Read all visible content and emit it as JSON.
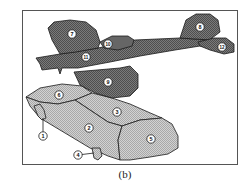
{
  "figure": {
    "caption": "(b)",
    "frame": {
      "x": 22,
      "y": 10,
      "width": 215,
      "height": 155,
      "stroke": "#555555"
    },
    "colors": {
      "airplane_fill": "#6e6e6e",
      "airplane_light_fill": "#8a8a8a",
      "car_fill": "#c4c4c4",
      "outline": "#1a1a1a",
      "label_bg": "#ffffff"
    },
    "objects": [
      {
        "name": "airplane",
        "parts": [
          "7",
          "8",
          "9",
          "10",
          "11",
          "12"
        ]
      },
      {
        "name": "car",
        "parts": [
          "1",
          "2",
          "3",
          "4",
          "5",
          "6"
        ]
      }
    ],
    "labels": [
      {
        "id": "1",
        "text": "1",
        "x": 43,
        "y": 136,
        "leader": {
          "x2": 43,
          "y2": 118
        }
      },
      {
        "id": "2",
        "text": "2",
        "x": 89,
        "y": 128
      },
      {
        "id": "3",
        "text": "3",
        "x": 117,
        "y": 112
      },
      {
        "id": "4",
        "text": "4",
        "x": 78,
        "y": 155,
        "leader": {
          "x2": 94,
          "y2": 153
        }
      },
      {
        "id": "5",
        "text": "5",
        "x": 151,
        "y": 139
      },
      {
        "id": "6",
        "text": "6",
        "x": 59,
        "y": 95
      },
      {
        "id": "7",
        "text": "7",
        "x": 72,
        "y": 34
      },
      {
        "id": "8",
        "text": "8",
        "x": 200,
        "y": 27
      },
      {
        "id": "9",
        "text": "9",
        "x": 108,
        "y": 82
      },
      {
        "id": "10",
        "text": "10",
        "x": 108,
        "y": 44
      },
      {
        "id": "11",
        "text": "11",
        "x": 86,
        "y": 57
      },
      {
        "id": "12",
        "text": "12",
        "x": 222,
        "y": 47
      }
    ]
  }
}
